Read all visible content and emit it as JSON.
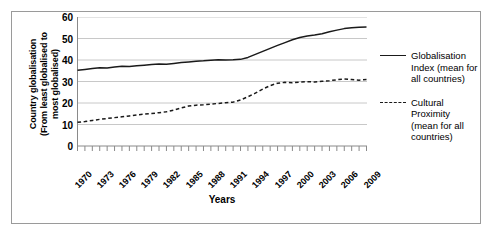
{
  "chart_data": {
    "type": "line",
    "title": "",
    "xlabel": "Years",
    "ylabel": "Country globalisation\n(From least globalised to most globalised)",
    "ylabel_line1": "Country globalisation",
    "ylabel_line2": "(From least globalised to",
    "ylabel_line3": "most globalised)",
    "xlim": [
      1970,
      2009
    ],
    "ylim": [
      0,
      60
    ],
    "ytick_values": [
      0,
      10,
      20,
      30,
      40,
      50,
      60
    ],
    "ytick_labels": [
      "0",
      "10",
      "20",
      "30",
      "40",
      "50",
      "60"
    ],
    "xtick_labels": [
      "1970",
      "1973",
      "1976",
      "1979",
      "1982",
      "1985",
      "1988",
      "1991",
      "1994",
      "1997",
      "2000",
      "2003",
      "2006",
      "2009"
    ],
    "xtick_label_interval": 3,
    "minor_tick_interval": 1,
    "grid": "horizontal",
    "legend_position": "right",
    "x": [
      1970,
      1971,
      1972,
      1973,
      1974,
      1975,
      1976,
      1977,
      1978,
      1979,
      1980,
      1981,
      1982,
      1983,
      1984,
      1985,
      1986,
      1987,
      1988,
      1989,
      1990,
      1991,
      1992,
      1993,
      1994,
      1995,
      1996,
      1997,
      1998,
      1999,
      2000,
      2001,
      2002,
      2003,
      2004,
      2005,
      2006,
      2007,
      2008,
      2009
    ],
    "series": [
      {
        "name": "Globalisation Index (mean for all countries)",
        "style": "solid",
        "color": "#1a1a1a",
        "values": [
          35.2,
          35.6,
          36.0,
          36.4,
          36.3,
          36.7,
          37.1,
          37.0,
          37.3,
          37.6,
          37.9,
          38.1,
          38.0,
          38.4,
          38.8,
          39.1,
          39.4,
          39.6,
          39.9,
          40.1,
          40.0,
          40.1,
          40.3,
          41.2,
          42.6,
          44.0,
          45.4,
          46.8,
          48.1,
          49.4,
          50.5,
          51.2,
          51.6,
          52.2,
          53.1,
          53.9,
          54.6,
          55.0,
          55.2,
          55.3
        ]
      },
      {
        "name": "Cultural Proximity (mean for all countries)",
        "style": "dashed",
        "color": "#1a1a1a",
        "values": [
          11.0,
          11.4,
          11.9,
          12.4,
          12.8,
          13.2,
          13.6,
          14.0,
          14.4,
          14.8,
          15.1,
          15.5,
          15.9,
          16.7,
          17.7,
          18.6,
          19.0,
          19.2,
          19.5,
          19.8,
          20.1,
          20.4,
          21.4,
          22.9,
          24.6,
          26.5,
          28.1,
          29.2,
          29.6,
          29.4,
          29.7,
          29.9,
          29.8,
          30.1,
          30.4,
          30.8,
          31.2,
          30.9,
          30.6,
          30.9
        ]
      }
    ],
    "legend": [
      {
        "style": "solid",
        "label": "Globalisation Index (mean for all countries)"
      },
      {
        "style": "dashed",
        "label": "Cultural Proximity (mean for all countries)"
      }
    ]
  }
}
